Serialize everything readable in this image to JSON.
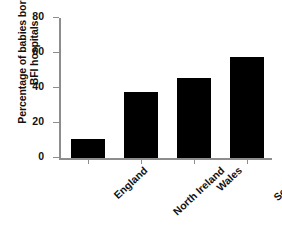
{
  "chart_data": {
    "type": "bar",
    "title": "",
    "subtitle": "",
    "xlabel": "",
    "ylabel_lines": [
      "Percentage of babies born in",
      "BFI hospitals"
    ],
    "ylabel": "Percentage of babies born in BFI hospitals",
    "categories": [
      "England",
      "North Ireland",
      "Wales",
      "Scotland"
    ],
    "values": [
      11,
      37.5,
      46,
      57.5
    ],
    "ylim": [
      0,
      80
    ],
    "yticks": [
      0,
      20,
      40,
      60,
      80
    ],
    "ytick_labels": [
      "0",
      "20",
      "40",
      "60",
      "80"
    ],
    "grid": false,
    "legend": false,
    "legend_position": "none",
    "bar_color": "#000000",
    "axis_color": "#8d8d8d",
    "text_color": "#111111",
    "background_color": "#ffffff",
    "xtick_label_rotation": -43
  }
}
